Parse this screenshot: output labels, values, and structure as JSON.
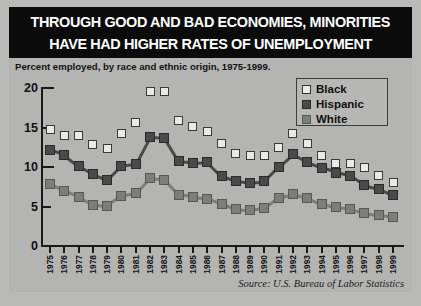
{
  "title": {
    "line1": "THROUGH GOOD AND BAD ECONOMIES, MINORITIES",
    "line2": "HAVE HAD HIGHER RATES OF UNEMPLOYMENT"
  },
  "subtitle": "Percent employed, by race and ethnic origin, 1975-1999.",
  "source": "Source: U.S. Bureau of Labor Statistics",
  "legend": {
    "title": "legend",
    "items": [
      {
        "label": "Black",
        "color": "#ececea",
        "marker": "open-square"
      },
      {
        "label": "Hispanic",
        "color": "#4a4a4a",
        "marker": "filled-square-dark"
      },
      {
        "label": "White",
        "color": "#7d7d7b",
        "marker": "filled-square-gray"
      }
    ]
  },
  "colors": {
    "banner_background": "#0b0b0b",
    "banner_text": "#ffffff",
    "panel_background": "#b4b4b2",
    "axis": "#1a1a1a",
    "black_series": "#ececea",
    "hispanic_series": "#4a4a4a",
    "white_series": "#7d7d7b"
  },
  "chart_data": {
    "type": "line",
    "title": "THROUGH GOOD AND BAD ECONOMIES, MINORITIES HAVE HAD HIGHER RATES OF UNEMPLOYMENT",
    "subtitle": "Percent employed, by race and ethnic origin, 1975-1999.",
    "xlabel": "",
    "ylabel": "",
    "ylim": [
      0,
      20
    ],
    "yticks": [
      0,
      5,
      10,
      15,
      20
    ],
    "grid": false,
    "legend_position": "top-right",
    "x": [
      1975,
      1976,
      1977,
      1978,
      1979,
      1980,
      1981,
      1982,
      1983,
      1984,
      1985,
      1986,
      1987,
      1988,
      1989,
      1990,
      1991,
      1992,
      1993,
      1994,
      1995,
      1996,
      1997,
      1998,
      1999
    ],
    "categories": [
      "1975",
      "1976",
      "1977",
      "1978",
      "1979",
      "1980",
      "1981",
      "1982",
      "1983",
      "1984",
      "1985",
      "1986",
      "1987",
      "1988",
      "1989",
      "1990",
      "1991",
      "1992",
      "1993",
      "1994",
      "1995",
      "1996",
      "1997",
      "1998",
      "1999"
    ],
    "series": [
      {
        "name": "Black",
        "marker": "open-square",
        "connected": false,
        "values": [
          14.8,
          14.0,
          14.0,
          12.8,
          12.3,
          14.3,
          15.6,
          19.6,
          19.5,
          15.9,
          15.1,
          14.5,
          13.0,
          11.7,
          11.4,
          11.4,
          12.5,
          14.2,
          13.0,
          11.5,
          10.4,
          10.5,
          10.0,
          8.9,
          8.0
        ]
      },
      {
        "name": "Hispanic",
        "marker": "filled-square-dark",
        "connected": true,
        "values": [
          12.2,
          11.5,
          10.1,
          9.1,
          8.3,
          10.1,
          10.4,
          13.8,
          13.7,
          10.7,
          10.5,
          10.6,
          8.8,
          8.2,
          8.0,
          8.2,
          10.0,
          11.6,
          10.6,
          9.9,
          9.3,
          8.9,
          7.7,
          7.2,
          6.4
        ]
      },
      {
        "name": "White",
        "marker": "filled-square-gray",
        "connected": true,
        "values": [
          7.8,
          7.0,
          6.2,
          5.2,
          5.1,
          6.3,
          6.7,
          8.6,
          8.4,
          6.5,
          6.2,
          6.0,
          5.3,
          4.7,
          4.5,
          4.8,
          6.1,
          6.6,
          6.1,
          5.3,
          4.9,
          4.7,
          4.2,
          3.9,
          3.7
        ]
      }
    ]
  }
}
